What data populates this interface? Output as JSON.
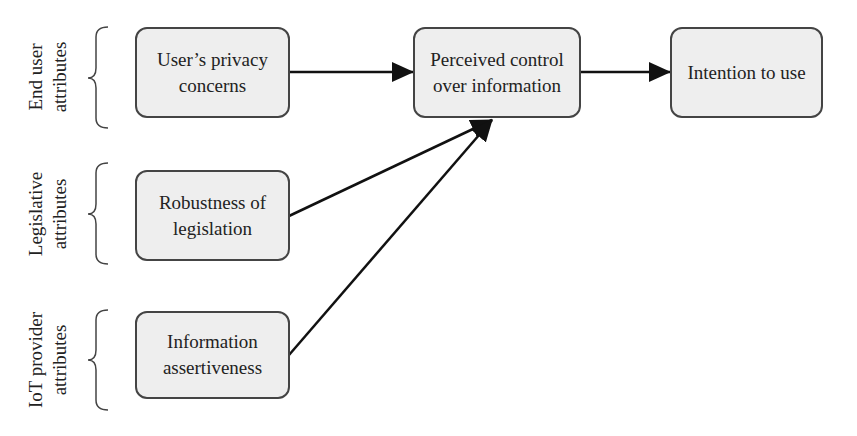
{
  "groups": [
    {
      "label": "End user attributes",
      "line1": "End user",
      "line2": "attributes"
    },
    {
      "label": "Legislative attributes",
      "line1": "Legislative",
      "line2": "attributes"
    },
    {
      "label": "IoT provider attributes",
      "line1": "IoT provider",
      "line2": "attributes"
    }
  ],
  "nodes": {
    "privacy": {
      "line1": "User’s privacy",
      "line2": "concerns"
    },
    "legislation": {
      "line1": "Robustness of",
      "line2": "legislation"
    },
    "assertiveness": {
      "line1": "Information",
      "line2": "assertiveness"
    },
    "control": {
      "line1": "Perceived control",
      "line2": "over information"
    },
    "intention": {
      "line1": "Intention to use"
    }
  },
  "edges": [
    {
      "from": "User’s privacy concerns",
      "to": "Perceived control over information"
    },
    {
      "from": "Robustness of legislation",
      "to": "Perceived control over information"
    },
    {
      "from": "Information assertiveness",
      "to": "Perceived control over information"
    },
    {
      "from": "Perceived control over information",
      "to": "Intention to use"
    }
  ],
  "colors": {
    "box_fill": "#eeeeee",
    "box_border": "#444444",
    "line": "#111111"
  }
}
